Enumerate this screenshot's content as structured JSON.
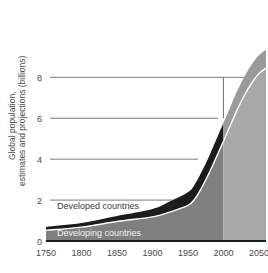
{
  "chart_data": {
    "type": "area",
    "title": "",
    "xlabel": "",
    "ylabel": "Global population, estimates and projections (billions)",
    "ylabel_line1": "Global population,",
    "ylabel_line2": "estimates and projections (billions)",
    "xlim": [
      1750,
      2060
    ],
    "ylim": [
      0,
      9.8
    ],
    "grid": "horizontal-only",
    "legend": "inline-annotations",
    "x_ticks": [
      1750,
      1800,
      1850,
      1900,
      1950,
      2000,
      2050
    ],
    "x_tick_labels": [
      "1750",
      "1800",
      "1850",
      "1900",
      "1950",
      "2000",
      "2050"
    ],
    "y_ticks": [
      0,
      2,
      4,
      6,
      8
    ],
    "y_tick_labels": [
      "0",
      "2",
      "4",
      "6",
      "8"
    ],
    "x": [
      1750,
      1800,
      1850,
      1900,
      1925,
      1950,
      1960,
      1970,
      1980,
      1990,
      2000,
      2010,
      2020,
      2030,
      2040,
      2050,
      2060
    ],
    "series": [
      {
        "name": "Developing countries",
        "label": "Developing countries",
        "color": "#7f7f7f",
        "projection_color": "#a8a8a8",
        "values": [
          0.52,
          0.68,
          0.95,
          1.18,
          1.42,
          1.74,
          2.07,
          2.65,
          3.33,
          4.09,
          4.87,
          5.67,
          6.46,
          7.15,
          7.73,
          8.18,
          8.45
        ]
      },
      {
        "name": "Developed countries",
        "label": "Developed countries",
        "color": "#1c1c1c",
        "projection_color": "#9a9a9a",
        "values": [
          0.17,
          0.2,
          0.27,
          0.38,
          0.52,
          0.64,
          0.72,
          0.78,
          0.83,
          0.87,
          0.9,
          0.91,
          0.92,
          0.92,
          0.91,
          0.9,
          0.89
        ]
      }
    ],
    "total_values": [
      0.69,
      0.88,
      1.22,
      1.56,
      1.94,
      2.38,
      2.79,
      3.43,
      4.16,
      4.96,
      5.77,
      6.58,
      7.38,
      8.07,
      8.64,
      9.08,
      9.34
    ],
    "annotations": [
      {
        "name": "projection-divider",
        "type": "vertical-line",
        "x": 2000,
        "y_from": 6,
        "y_to": 8,
        "color": "#6b6b6b"
      },
      {
        "name": "projection-start-marker",
        "type": "region-start",
        "x": 2000,
        "note": "shading lightens after year 2000 to indicate projections"
      }
    ],
    "colors": {
      "developing": "#7f7f7f",
      "developed": "#1c1c1c",
      "developing_projection": "#a8a8a8",
      "developed_projection": "#9a9a9a",
      "grid": "#6b6b6b",
      "axis": "#1c1c1c",
      "text": "#4a4a4a",
      "separator": "#ffffff",
      "background": "#ffffff"
    }
  }
}
